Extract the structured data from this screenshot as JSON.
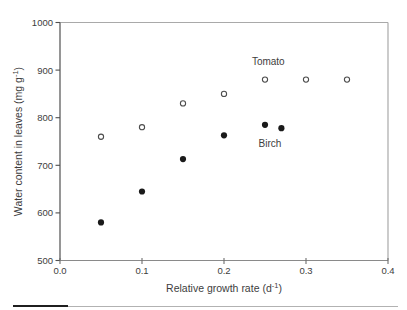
{
  "figure": {
    "background": "#ffffff"
  },
  "colors": {
    "axis_dark": "#4f4f4f",
    "axis_light": "#a9a9a9",
    "tick": "#6e6e6e",
    "text": "#3d3d3d",
    "open_marker_stroke": "#4d4d4d",
    "open_marker_fill": "#ffffff",
    "filled_marker": "#1a1a1a",
    "divider_dark": "#1f1f1f",
    "divider_light": "#b2b2b2"
  },
  "chart_data": {
    "type": "scatter",
    "title": "",
    "xlabel": {
      "pre": "Relative growth rate (d",
      "sup": "-1",
      "post": ")"
    },
    "ylabel": {
      "pre": "Water content in leaves (mg g",
      "sup": "-1",
      "post": ")"
    },
    "xlim": [
      0,
      0.4
    ],
    "ylim": [
      500,
      1000
    ],
    "grid": false,
    "legend_position": "inline-annotations",
    "xticks": [
      {
        "v": 0.0,
        "label": "0.0"
      },
      {
        "v": 0.1,
        "label": "0.1"
      },
      {
        "v": 0.2,
        "label": "0.2"
      },
      {
        "v": 0.3,
        "label": "0.3"
      },
      {
        "v": 0.4,
        "label": "0.4"
      }
    ],
    "yticks": [
      {
        "v": 500,
        "label": "500"
      },
      {
        "v": 600,
        "label": "600"
      },
      {
        "v": 700,
        "label": "700"
      },
      {
        "v": 800,
        "label": "800"
      },
      {
        "v": 900,
        "label": "900"
      },
      {
        "v": 1000,
        "label": "1000"
      }
    ],
    "series": [
      {
        "name": "Tomato",
        "marker": "open-circle",
        "points": [
          [
            0.05,
            760
          ],
          [
            0.1,
            780
          ],
          [
            0.15,
            830
          ],
          [
            0.2,
            850
          ],
          [
            0.25,
            880
          ],
          [
            0.3,
            880
          ],
          [
            0.35,
            880
          ]
        ]
      },
      {
        "name": "Birch",
        "marker": "filled-circle",
        "points": [
          [
            0.05,
            580
          ],
          [
            0.1,
            645
          ],
          [
            0.15,
            713
          ],
          [
            0.2,
            763
          ],
          [
            0.25,
            785
          ],
          [
            0.27,
            778
          ]
        ]
      }
    ],
    "annotations": [
      {
        "text": "Tomato",
        "x": 0.254,
        "y": 918
      },
      {
        "text": "Birch",
        "x": 0.256,
        "y": 746
      }
    ]
  }
}
